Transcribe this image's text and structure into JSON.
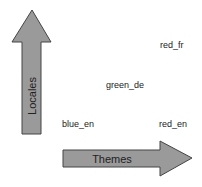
{
  "diagram": {
    "axes": {
      "vertical": {
        "label": "Locales"
      },
      "horizontal": {
        "label": "Themes"
      }
    },
    "points": [
      {
        "label": "red_fr"
      },
      {
        "label": "green_de"
      },
      {
        "label": "blue_en"
      },
      {
        "label": "red_en"
      }
    ],
    "colors": {
      "arrow_fill": "#9a9a9a",
      "arrow_stroke": "#444444",
      "text": "#222222"
    }
  }
}
